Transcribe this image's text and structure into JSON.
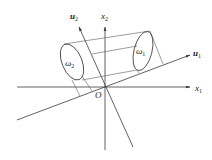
{
  "diagram": {
    "origin_label": "O",
    "axes": {
      "x1": {
        "label": "x",
        "sub": "1"
      },
      "x2": {
        "label": "x",
        "sub": "2"
      },
      "u1": {
        "label": "u",
        "sub": "1"
      },
      "u2": {
        "label": "u",
        "sub": "2"
      }
    },
    "regions": {
      "omega1": {
        "label": "ω",
        "sub": "1"
      },
      "omega2": {
        "label": "ω",
        "sub": "2"
      }
    },
    "colors": {
      "line": "#3a3a3a",
      "text": "#222222",
      "background": "#ffffff"
    }
  }
}
